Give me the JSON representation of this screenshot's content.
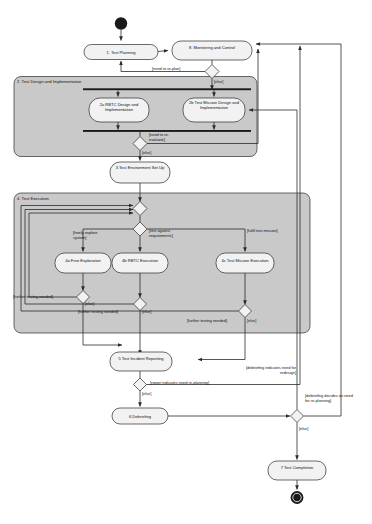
{
  "diagram": {
    "type": "uml-activity-diagram",
    "background": "#ffffff",
    "node_fill": "#f2f2f2",
    "region_fill": "#c9c9c9",
    "stroke": "#2b2b2b"
  },
  "nodes": {
    "start": {
      "label": "",
      "kind": "initial-node"
    },
    "n1": {
      "label": "1. Test Planning",
      "kind": "activity"
    },
    "n8": {
      "label": "8. Monitoring and Control",
      "kind": "activity"
    },
    "n2a": {
      "label": "2a RBTC Design and Implementation",
      "kind": "activity"
    },
    "n2b": {
      "label": "2b Test Mission Design and Implementation",
      "kind": "activity"
    },
    "n3": {
      "label": "3 Test Environment Set Up",
      "kind": "activity"
    },
    "n4a": {
      "label": "4a Free Exploration",
      "kind": "activity"
    },
    "n4b": {
      "label": "4b RBTC Execution",
      "kind": "activity"
    },
    "n4c": {
      "label": "4c Test Mission Execution",
      "kind": "activity"
    },
    "n5": {
      "label": "5 Test Incident Reporting",
      "kind": "activity"
    },
    "n6": {
      "label": "6 Debriefing",
      "kind": "activity"
    },
    "n7": {
      "label": "7 Test Completion",
      "kind": "activity"
    },
    "final": {
      "label": "",
      "kind": "final-node"
    }
  },
  "regions": {
    "r2": {
      "title": "2. Test Design and Implementation"
    },
    "r4": {
      "title": "4. Test Execution"
    }
  },
  "guards": {
    "need_replan": "[need to re-plan]",
    "else_after_replan": "[else]",
    "need_reevaluate": "[need to re-evaluate]",
    "else_after_reeval": "[else]",
    "freely_explore": "[freely explore system]",
    "test_against_req": "[test against requirements]",
    "fulfil_mission": "[fulfil test mission]",
    "further_testing_a": "[further testing needed]",
    "else_exec_a": "[else]",
    "further_testing_b": "[further testing needed]",
    "else_exec_b": "[else]",
    "further_testing_c": "[further testing needed]",
    "else_exec_c": "[else]",
    "report_replanning": "[report indicates need re-planning]",
    "else_after_report": "[else]",
    "debrief_redesign": "[debriefing indicates need for redesign]",
    "debrief_replanning": "[debriefing decides on need for re-planning]",
    "else_after_debrief": "[else]"
  }
}
